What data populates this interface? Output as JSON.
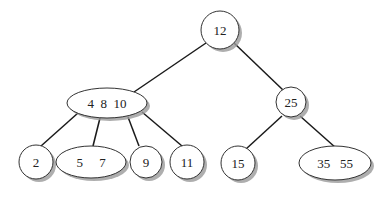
{
  "diagram": {
    "type": "b-tree",
    "nodes": [
      {
        "id": "n12",
        "keys": "12",
        "label": "12"
      },
      {
        "id": "n4_8_10",
        "keys": "4 8 10",
        "label": "4  8  10"
      },
      {
        "id": "n25",
        "keys": "25",
        "label": "25"
      },
      {
        "id": "n2",
        "keys": "2",
        "label": "2"
      },
      {
        "id": "n5_7",
        "keys": "5 7",
        "label": "5     7"
      },
      {
        "id": "n9",
        "keys": "9",
        "label": "9"
      },
      {
        "id": "n11",
        "keys": "11",
        "label": "11"
      },
      {
        "id": "n15",
        "keys": "15",
        "label": "15"
      },
      {
        "id": "n35_55",
        "keys": "35 55",
        "label": "35   55"
      }
    ],
    "edges": [
      {
        "from": "12",
        "to": "4 8 10"
      },
      {
        "from": "12",
        "to": "25"
      },
      {
        "from": "4 8 10",
        "to": "2"
      },
      {
        "from": "4 8 10",
        "to": "5 7"
      },
      {
        "from": "4 8 10",
        "to": "9"
      },
      {
        "from": "4 8 10",
        "to": "11"
      },
      {
        "from": "25",
        "to": "15"
      },
      {
        "from": "25",
        "to": "35 55"
      }
    ]
  }
}
